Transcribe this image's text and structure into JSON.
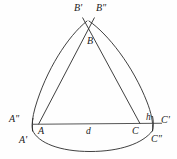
{
  "figure": {
    "background_color": "#fefefe",
    "stroke_color": "#2a2a2a",
    "stroke_width": 0.9,
    "baseline_color": "#555555",
    "labels": {
      "b_prime": "B'",
      "b_double_prime": "B\"",
      "b": "B",
      "a_double_prime": "A\"",
      "a": "A",
      "a_prime": "A'",
      "c": "C",
      "c_prime": "C'",
      "c_double_prime": "C\"",
      "h": "h",
      "d": "d"
    }
  },
  "geometry": {
    "apex_x": 88,
    "apex_y": 22,
    "baseline_y": 124,
    "baseline_left_x": 33,
    "baseline_right_x": 162,
    "triangle_a_x": 38,
    "triangle_c_x": 140,
    "arc_left_end_x": 33,
    "arc_left_end_y": 131,
    "arc_right_end_x": 153,
    "arc_right_end_y": 131
  }
}
